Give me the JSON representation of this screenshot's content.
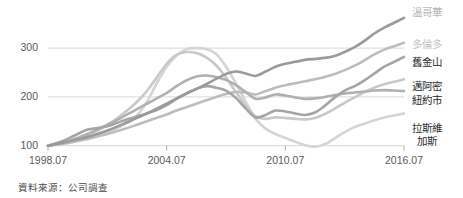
{
  "chart_data": {
    "type": "line",
    "title": "",
    "subtitle": "",
    "xlabel": "",
    "ylabel": "",
    "source_note": "資料來源：公司調查",
    "grid": true,
    "legend_position": "right",
    "index_base": 100,
    "xlim": [
      1998.58,
      2016.58
    ],
    "ylim": [
      85,
      370
    ],
    "yticks": [
      100,
      200,
      300
    ],
    "ytick_labels": [
      "100",
      "200",
      "300"
    ],
    "xticks": [
      1998.58,
      2004.58,
      2010.58,
      2016.58
    ],
    "xtick_labels": [
      "1998.07",
      "2004.07",
      "2010.07",
      "2016.07"
    ],
    "x": [
      1998.58,
      1999.08,
      1999.58,
      2000.08,
      2000.58,
      2001.08,
      2001.58,
      2002.08,
      2002.58,
      2003.08,
      2003.58,
      2004.08,
      2004.58,
      2005.08,
      2005.58,
      2006.08,
      2006.58,
      2007.08,
      2007.58,
      2008.08,
      2008.58,
      2009.08,
      2009.58,
      2010.08,
      2010.58,
      2011.08,
      2011.58,
      2012.08,
      2012.58,
      2013.08,
      2013.58,
      2014.08,
      2014.58,
      2015.08,
      2015.58,
      2016.08,
      2016.58
    ],
    "series": [
      {
        "name": "溫哥華",
        "name_en": "Vancouver",
        "color": "#9a9a9a",
        "label_color": "#b5b5b5",
        "values": [
          100,
          104,
          108,
          113,
          118,
          124,
          131,
          139,
          148,
          157,
          166,
          176,
          186,
          197,
          207,
          216,
          226,
          237,
          247,
          252,
          248,
          243,
          252,
          262,
          268,
          272,
          276,
          278,
          280,
          284,
          292,
          302,
          315,
          330,
          342,
          352,
          362
        ]
      },
      {
        "name": "多倫多",
        "name_en": "Toronto",
        "color": "#bdbdbd",
        "label_color": "#c4c4c4",
        "values": [
          100,
          103,
          106,
          110,
          114,
          119,
          124,
          130,
          136,
          143,
          150,
          157,
          164,
          172,
          179,
          186,
          193,
          200,
          206,
          210,
          209,
          205,
          212,
          219,
          224,
          228,
          232,
          236,
          241,
          247,
          255,
          264,
          275,
          287,
          297,
          304,
          311
        ]
      },
      {
        "name": "舊金山",
        "name_en": "San Francisco",
        "color": "#a5a5a5",
        "label_color": "#2b2b2b",
        "values": [
          100,
          106,
          114,
          124,
          133,
          136,
          140,
          147,
          154,
          160,
          166,
          173,
          183,
          196,
          207,
          217,
          222,
          219,
          213,
          198,
          176,
          158,
          163,
          172,
          170,
          166,
          163,
          168,
          182,
          199,
          213,
          222,
          234,
          248,
          262,
          272,
          282
        ]
      },
      {
        "name": "邁阿密",
        "name_en": "Miami",
        "color": "#c9c9c9",
        "label_color": "#2b2b2b",
        "values": [
          100,
          103,
          108,
          114,
          122,
          131,
          142,
          156,
          172,
          190,
          212,
          240,
          268,
          286,
          292,
          290,
          281,
          265,
          240,
          210,
          182,
          160,
          155,
          158,
          157,
          155,
          154,
          157,
          165,
          176,
          188,
          199,
          210,
          219,
          226,
          231,
          236
        ]
      },
      {
        "name": "紐約市",
        "name_en": "New York City",
        "color": "#b0b0b0",
        "label_color": "#2b2b2b",
        "values": [
          100,
          104,
          109,
          116,
          124,
          133,
          143,
          153,
          164,
          175,
          186,
          197,
          208,
          222,
          234,
          242,
          244,
          241,
          235,
          224,
          210,
          196,
          199,
          205,
          203,
          199,
          196,
          197,
          200,
          204,
          207,
          209,
          211,
          213,
          214,
          213,
          212
        ]
      },
      {
        "name": "拉斯維加斯",
        "name_en": "Las Vegas",
        "color": "#d5d5d5",
        "label_color": "#2b2b2b",
        "values": [
          100,
          102,
          105,
          109,
          114,
          120,
          127,
          136,
          147,
          162,
          190,
          228,
          262,
          285,
          298,
          300,
          298,
          288,
          262,
          228,
          190,
          155,
          135,
          124,
          116,
          108,
          101,
          98,
          103,
          115,
          128,
          138,
          145,
          152,
          158,
          162,
          166
        ]
      }
    ]
  },
  "legend": [
    {
      "lines": [
        "溫哥華"
      ],
      "top": 6
    },
    {
      "lines": [
        "多倫多"
      ],
      "top": 38
    },
    {
      "lines": [
        "舊金山"
      ],
      "top": 56
    },
    {
      "lines": [
        "邁阿密"
      ],
      "top": 80
    },
    {
      "lines": [
        "紐約市"
      ],
      "top": 94
    },
    {
      "lines": [
        "拉斯維",
        "加斯"
      ],
      "top": 122
    }
  ],
  "colors": {
    "grid": "#d9d9d9",
    "axis": "#b0b0b0",
    "tick_text": "#5a5a5a",
    "note_text": "#4a4a4a"
  }
}
